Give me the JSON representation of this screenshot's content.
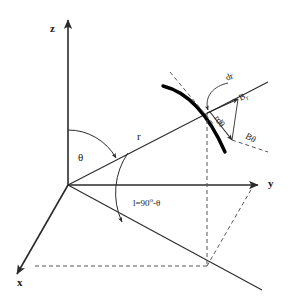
{
  "figure": {
    "type": "spherical-coordinate-diagram",
    "background_color": "#ffffff",
    "line_color": "#2b2b2b",
    "fieldline_color": "#000000",
    "dash_color": "#555555"
  },
  "axes": {
    "z_label": "z",
    "y_label": "y",
    "x_label": "x"
  },
  "labels": {
    "theta": "θ",
    "radius": "r",
    "latitude_base": "l=90",
    "latitude_degree": "o",
    "latitude_tail": "-θ",
    "dr": "dr",
    "b_r_base": "B",
    "b_r_sub": "r",
    "r_dtheta": "rdθ",
    "b_theta": "Bθ"
  },
  "geometry": {
    "origin": [
      68,
      185
    ],
    "z_axis_tip": [
      68,
      18
    ],
    "y_axis_tip": [
      262,
      185
    ],
    "x_axis_tip": [
      14,
      277
    ],
    "point_p": [
      207,
      113
    ],
    "ground_point": [
      207,
      266
    ],
    "theta_arc_deg": 27,
    "latitude_arc_deg": 63
  }
}
